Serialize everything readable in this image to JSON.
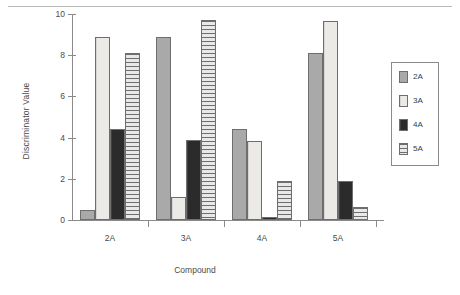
{
  "chart_data": {
    "type": "bar",
    "title": "",
    "xlabel": "Compound",
    "ylabel": "Discriminator Value",
    "categories": [
      "2A",
      "3A",
      "4A",
      "5A"
    ],
    "series": [
      {
        "name": "2A",
        "values": [
          0.5,
          8.9,
          4.4,
          8.1
        ]
      },
      {
        "name": "3A",
        "values": [
          8.9,
          1.1,
          3.85,
          9.65
        ]
      },
      {
        "name": "4A",
        "values": [
          4.4,
          3.9,
          0.15,
          1.9
        ]
      },
      {
        "name": "5A",
        "values": [
          8.1,
          9.7,
          1.9,
          0.65
        ]
      }
    ],
    "ylim": [
      0,
      10
    ],
    "yticks": [
      0,
      2,
      4,
      6,
      8,
      10
    ],
    "ytick_labels": [
      "0",
      "2",
      "4",
      "6",
      "8",
      "10"
    ],
    "grid": false,
    "legend_position": "right",
    "legend_entries": [
      "2A",
      "3A",
      "4A",
      "5A"
    ],
    "series_colors": [
      "#a9a9a9",
      "#eceae6",
      "#2b2b2b",
      "#cfcfcf"
    ]
  }
}
